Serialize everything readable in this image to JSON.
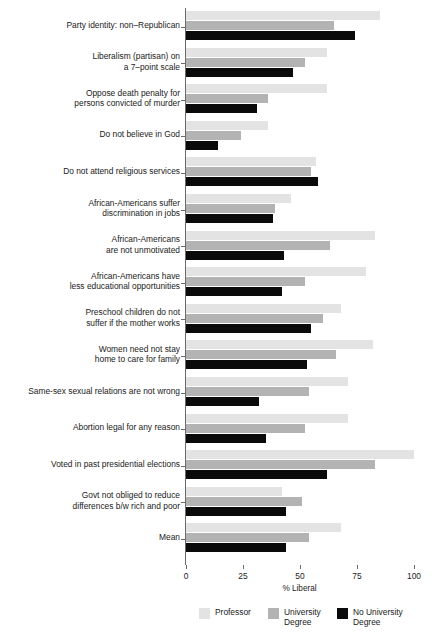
{
  "chart_data": {
    "type": "bar",
    "orientation": "horizontal",
    "title": "",
    "xlabel": "% Liberal",
    "ylabel": "",
    "xlim": [
      0,
      100
    ],
    "xticks": [
      0,
      25,
      50,
      75,
      100
    ],
    "xtick_labels": [
      "0",
      "25",
      "50",
      "75",
      "100"
    ],
    "grid": false,
    "legend_position": "bottom",
    "categories": [
      "Party identity: non–Republican",
      "Liberalism (partisan) on\na 7–point scale",
      "Oppose death penalty for\npersons convicted of murder",
      "Do not believe in God",
      "Do not attend religious services",
      "African-Americans suffer\ndiscrimination in jobs",
      "African-Americans\nare not unmotivated",
      "African-Americans have\nless educational opportunities",
      "Preschool children do not\nsuffer if the mother works",
      "Women need not stay\nhome to care for family",
      "Same-sex sexual relations are not wrong",
      "Abortion legal for any reason",
      "Voted in past presidential elections",
      "Govt not obliged to reduce\ndifferences b/w rich and poor",
      "Mean"
    ],
    "series": [
      {
        "name": "Professor",
        "color": "#e3e3e3",
        "values": [
          85,
          62,
          62,
          36,
          57,
          46,
          83,
          79,
          68,
          82,
          71,
          71,
          100,
          42,
          68
        ]
      },
      {
        "name": "University Degree",
        "color": "#b3b3b3",
        "values": [
          65,
          52,
          36,
          24,
          55,
          39,
          63,
          52,
          60,
          66,
          54,
          52,
          83,
          51,
          54
        ]
      },
      {
        "name": "No University Degree",
        "color": "#0a0a0a",
        "values": [
          74,
          47,
          31,
          14,
          58,
          38,
          43,
          42,
          55,
          53,
          32,
          35,
          62,
          44,
          44
        ]
      }
    ]
  },
  "legend": {
    "items": [
      {
        "label": "Professor",
        "color": "#e3e3e3"
      },
      {
        "label": "University\nDegree",
        "color": "#b3b3b3"
      },
      {
        "label": "No University\nDegree",
        "color": "#0a0a0a"
      }
    ]
  }
}
